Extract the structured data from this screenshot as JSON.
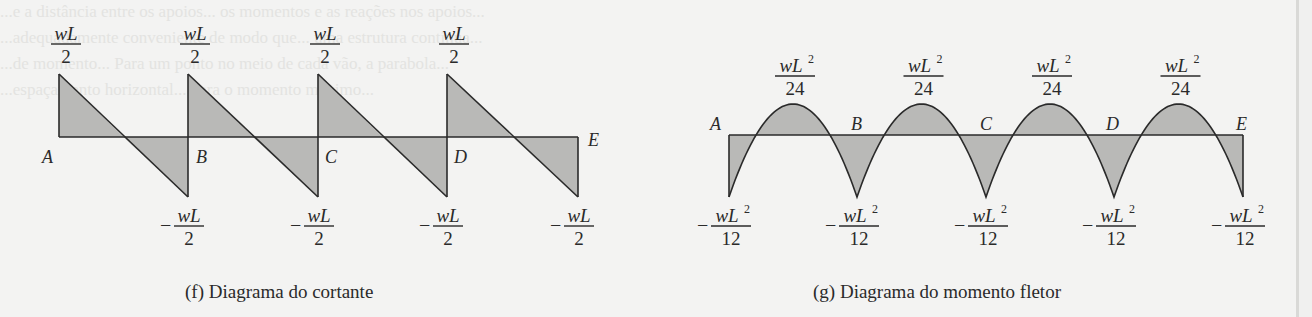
{
  "figure": {
    "background_color": "#f3f3f2",
    "fill_color": "#b9b9b7",
    "line_color": "#2a2a2a",
    "shear_diagram": {
      "caption": "(f) Diagrama do cortante",
      "support_labels": [
        "A",
        "B",
        "C",
        "D",
        "E"
      ],
      "positive_label": {
        "numerator": "wL",
        "denominator": "2"
      },
      "negative_label": {
        "sign": "−",
        "numerator": "wL",
        "denominator": "2"
      },
      "positive_label_count": 4,
      "negative_label_count": 4
    },
    "moment_diagram": {
      "caption": "(g) Diagrama do momento fletor",
      "support_labels": [
        "A",
        "B",
        "C",
        "D",
        "E"
      ],
      "positive_label": {
        "numerator": "wL",
        "exponent": "2",
        "denominator": "24"
      },
      "negative_label": {
        "sign": "−",
        "numerator": "wL",
        "exponent": "2",
        "denominator": "12"
      },
      "positive_label_count": 4,
      "negative_label_count": 5
    }
  },
  "chart_data": [
    {
      "type": "line",
      "title": "(f) Diagrama do cortante",
      "x_labels": [
        "A",
        "B",
        "C",
        "D",
        "E"
      ],
      "unit": "wL",
      "segments": [
        {
          "span": "A-B",
          "start": 0.5,
          "end": -0.5
        },
        {
          "span": "B-C",
          "start": 0.5,
          "end": -0.5
        },
        {
          "span": "C-D",
          "start": 0.5,
          "end": -0.5
        },
        {
          "span": "D-E",
          "start": 0.5,
          "end": -0.5
        }
      ],
      "annotations": [
        "wL/2",
        "-wL/2"
      ]
    },
    {
      "type": "line",
      "title": "(g) Diagrama do momento fletor",
      "x_labels": [
        "A",
        "B",
        "C",
        "D",
        "E"
      ],
      "unit": "wL^2",
      "support_values": [
        -0.08333,
        -0.08333,
        -0.08333,
        -0.08333,
        -0.08333
      ],
      "midspan_values": [
        0.041667,
        0.041667,
        0.041667,
        0.041667
      ],
      "annotations": [
        "wL^2/24",
        "-wL^2/12"
      ]
    }
  ],
  "bleed_through_text": [
    "...e a distância entre os apoios... os momentos e as reações nos apoios...",
    "...adequadamente conveniente de modo que... uma estrutura contínua...",
    "...de momento... Para um ponto no meio de cada vão, a parabola...",
    "...espaçamento horizontal... para o momento máximo..."
  ]
}
